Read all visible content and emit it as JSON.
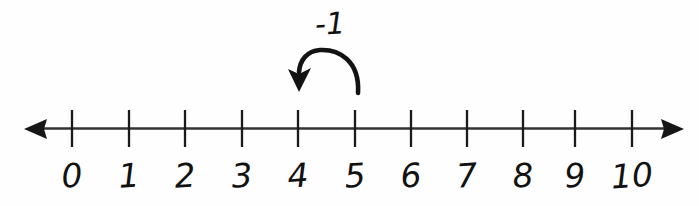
{
  "diagram": {
    "axis": {
      "label": "number-line-axis",
      "left_arrow": "arrow-left",
      "right_arrow": "arrow-right",
      "line_color": "#333333",
      "tick_color": "#1a1a1a"
    },
    "ticks": [
      {
        "value": 0,
        "label": "0",
        "x": 72
      },
      {
        "value": 1,
        "label": "1",
        "x": 129
      },
      {
        "value": 2,
        "label": "2",
        "x": 185
      },
      {
        "value": 3,
        "label": "3",
        "x": 242
      },
      {
        "value": 4,
        "label": "4",
        "x": 298
      },
      {
        "value": 5,
        "label": "5",
        "x": 355
      },
      {
        "value": 6,
        "label": "6",
        "x": 411
      },
      {
        "value": 7,
        "label": "7",
        "x": 467
      },
      {
        "value": 8,
        "label": "8",
        "x": 523
      },
      {
        "value": 9,
        "label": "9",
        "x": 575
      },
      {
        "value": 10,
        "label": "10",
        "x": 632
      }
    ],
    "jump": {
      "label": "-1",
      "from": 5,
      "to": 4,
      "direction": "left",
      "arrow_color": "#111111",
      "label_x": 330,
      "label_y": 6
    }
  },
  "chart_data": {
    "type": "number-line",
    "title": "",
    "xlabel": "",
    "ylabel": "",
    "xlim": [
      0,
      10
    ],
    "tick_labels": [
      "0",
      "1",
      "2",
      "3",
      "4",
      "5",
      "6",
      "7",
      "8",
      "9",
      "10"
    ],
    "tick_values": [
      0,
      1,
      2,
      3,
      4,
      5,
      6,
      7,
      8,
      9,
      10
    ],
    "annotations": [
      {
        "text": "-1",
        "type": "curved-arrow",
        "start_value": 5,
        "end_value": 4,
        "delta": -1
      }
    ],
    "grid": false,
    "legend": "none"
  }
}
